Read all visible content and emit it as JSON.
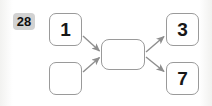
{
  "problem": {
    "number": "28"
  },
  "diagram": {
    "type": "flowchart",
    "nodes": [
      {
        "id": "input-1",
        "label": "1",
        "role": "input",
        "x": 49,
        "y": 13,
        "w": 33,
        "h": 33
      },
      {
        "id": "input-2",
        "label": "",
        "role": "input",
        "x": 49,
        "y": 62,
        "w": 33,
        "h": 33
      },
      {
        "id": "process",
        "label": "",
        "role": "process",
        "x": 101,
        "y": 39,
        "w": 44,
        "h": 31
      },
      {
        "id": "output-3",
        "label": "3",
        "role": "output",
        "x": 166,
        "y": 13,
        "w": 33,
        "h": 33
      },
      {
        "id": "output-7",
        "label": "7",
        "role": "output",
        "x": 166,
        "y": 62,
        "w": 33,
        "h": 33
      }
    ],
    "edges": [
      {
        "id": "edge-input1-process",
        "from": "input-1",
        "to": "process",
        "direction": "down-right"
      },
      {
        "id": "edge-input2-process",
        "from": "input-2",
        "to": "process",
        "direction": "up-right"
      },
      {
        "id": "edge-process-output3",
        "from": "process",
        "to": "output-3",
        "direction": "up-right"
      },
      {
        "id": "edge-process-output7",
        "from": "process",
        "to": "output-7",
        "direction": "down-right"
      }
    ]
  },
  "colors": {
    "background": "#fdfdfd",
    "node_border": "#9a9a9a",
    "node_fill": "#ffffff",
    "text": "#171717",
    "arrow": "#8e8e8e",
    "badge_fill": "#d2d2d2",
    "badge_text": "#101010"
  }
}
